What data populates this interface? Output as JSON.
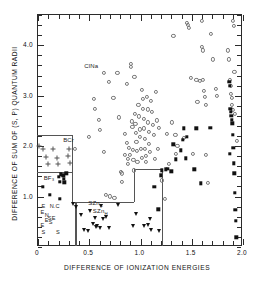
{
  "figure": {
    "type": "structure-field-map",
    "background": "#ffffff",
    "frame_color": "#2b2b2b",
    "region_line_color": "#555555"
  },
  "axes": {
    "xtitle": "DIFFERENCE OF IONIZATION ENERGIES",
    "ytitle": "DIFFERENCE OF SUM OF (S, P) QUANTUM RADII",
    "xlim": [
      0,
      2.0
    ],
    "ylim": [
      0,
      4.6
    ],
    "xticklabels": [
      "0",
      "0.5",
      "1.0",
      "1.5",
      "2.0"
    ],
    "xtickvalues": [
      0,
      0.5,
      1.0,
      1.5,
      2.0
    ],
    "yticklabels": [
      "1.0",
      "2.0",
      "3.0",
      "4.0"
    ],
    "ytickvalues": [
      1.0,
      2.0,
      3.0,
      4.0
    ],
    "xminor_step": 0.1,
    "yminor_step": 0.2,
    "grid": false
  },
  "region_labels": [
    {
      "name": "rocksalt",
      "text": "ClNa",
      "x": 0.46,
      "y": 3.55
    },
    {
      "name": "bcr",
      "text": "BCr",
      "x": 0.255,
      "y": 2.08
    },
    {
      "name": "bf3",
      "text": "BF₃",
      "x": 0.065,
      "y": 1.33
    },
    {
      "name": "szn-c",
      "text": "SZn",
      "sub": "C",
      "x": 0.5,
      "y": 0.83
    },
    {
      "name": "szn-h",
      "text": "SZn",
      "sub": "H",
      "x": 0.545,
      "y": 0.67
    }
  ],
  "corner_letters": [
    {
      "ch": "E",
      "x": 0.045,
      "y": 0.8
    },
    {
      "ch": "N.C",
      "x": 0.125,
      "y": 0.8
    },
    {
      "ch": "E",
      "x": 0.035,
      "y": 0.665
    },
    {
      "ch": "N",
      "x": 0.075,
      "y": 0.615
    },
    {
      "ch": "S",
      "x": 0.105,
      "y": 0.565
    },
    {
      "ch": "E",
      "x": 0.075,
      "y": 0.525
    },
    {
      "ch": "E",
      "x": 0.145,
      "y": 0.565
    },
    {
      "ch": "S",
      "x": 0.115,
      "y": 0.475
    },
    {
      "ch": "E",
      "x": 0.035,
      "y": 0.41
    },
    {
      "ch": "S",
      "x": 0.045,
      "y": 0.27
    },
    {
      "ch": "S",
      "x": 0.185,
      "y": 0.27
    }
  ],
  "region_boundaries": [
    {
      "name": "bcr-box-top",
      "orient": "h",
      "x0": 0.0,
      "x1": 0.345,
      "y": 2.2
    },
    {
      "name": "bcr-box-right",
      "orient": "v",
      "x": 0.345,
      "y0": 0.86,
      "y1": 2.2
    },
    {
      "name": "bf3-divider",
      "orient": "h",
      "x0": 0.0,
      "x1": 0.345,
      "y": 1.47
    },
    {
      "name": "szn-box-top",
      "orient": "h",
      "x0": 0.345,
      "x1": 0.945,
      "y": 0.875
    },
    {
      "name": "szn-riser",
      "orient": "v",
      "x": 0.945,
      "y0": 0.875,
      "y1": 1.52
    },
    {
      "name": "szn-shelf",
      "orient": "h",
      "x0": 0.945,
      "x1": 1.215,
      "y": 1.52
    },
    {
      "name": "szn-right",
      "orient": "v",
      "x": 1.215,
      "y0": 0.0,
      "y1": 1.52
    },
    {
      "name": "corner-box-right",
      "orient": "v",
      "x": 0.375,
      "y0": 0.0,
      "y1": 0.875
    }
  ],
  "chart_data": {
    "type": "scatter",
    "title": "",
    "xlabel": "DIFFERENCE OF IONIZATION ENERGIES",
    "ylabel": "DIFFERENCE OF SUM OF (S, P) QUANTUM RADII",
    "xlim": [
      0,
      2.0
    ],
    "ylim": [
      0,
      4.6
    ],
    "series": [
      {
        "name": "ClNa (rock salt)",
        "marker": "open-circle",
        "color": "#777777",
        "points": [
          [
            0.37,
            1.93
          ],
          [
            0.51,
            2.17
          ],
          [
            0.555,
            2.92
          ],
          [
            0.565,
            2.72
          ],
          [
            0.6,
            2.5
          ],
          [
            0.615,
            2.3
          ],
          [
            0.65,
            3.43
          ],
          [
            0.655,
            1.86
          ],
          [
            0.67,
            1.02
          ],
          [
            0.7,
            3.26
          ],
          [
            0.715,
            0.985
          ],
          [
            0.745,
            2.93
          ],
          [
            0.755,
            0.96
          ],
          [
            0.785,
            3.44
          ],
          [
            0.8,
            2.55
          ],
          [
            0.815,
            1.47
          ],
          [
            0.825,
            1.44
          ],
          [
            0.83,
            1.27
          ],
          [
            0.855,
            2.22
          ],
          [
            0.86,
            1.8
          ],
          [
            0.875,
            3.22
          ],
          [
            0.88,
            2.05
          ],
          [
            0.885,
            1.73
          ],
          [
            0.89,
            1.62
          ],
          [
            0.9,
            1.95
          ],
          [
            0.905,
            1.81
          ],
          [
            0.915,
            3.61
          ],
          [
            0.92,
            3.55
          ],
          [
            0.925,
            2.47
          ],
          [
            0.93,
            2.36
          ],
          [
            0.935,
            1.9
          ],
          [
            0.94,
            1.7
          ],
          [
            0.945,
            1.5
          ],
          [
            0.95,
            3.35
          ],
          [
            0.955,
            2.62
          ],
          [
            0.96,
            2.42
          ],
          [
            0.965,
            2.24
          ],
          [
            0.97,
            2.06
          ],
          [
            0.975,
            1.88
          ],
          [
            0.98,
            1.66
          ],
          [
            0.99,
            2.8
          ],
          [
            0.995,
            2.57
          ],
          [
            1.0,
            2.31
          ],
          [
            1.005,
            2.16
          ],
          [
            1.01,
            1.92
          ],
          [
            1.02,
            1.75
          ],
          [
            1.025,
            3.09
          ],
          [
            1.03,
            2.91
          ],
          [
            1.035,
            2.72
          ],
          [
            1.04,
            2.52
          ],
          [
            1.045,
            2.33
          ],
          [
            1.05,
            2.13
          ],
          [
            1.055,
            1.93
          ],
          [
            1.06,
            1.79
          ],
          [
            1.065,
            1.66
          ],
          [
            1.07,
            2.95
          ],
          [
            1.08,
            2.71
          ],
          [
            1.085,
            2.45
          ],
          [
            1.09,
            2.27
          ],
          [
            1.095,
            2.02
          ],
          [
            1.1,
            1.86
          ],
          [
            1.11,
            2.88
          ],
          [
            1.12,
            2.66
          ],
          [
            1.13,
            2.4
          ],
          [
            1.14,
            2.21
          ],
          [
            1.15,
            1.73
          ],
          [
            1.16,
            3.06
          ],
          [
            1.17,
            2.49
          ],
          [
            1.18,
            1.93
          ],
          [
            1.19,
            2.34
          ],
          [
            1.22,
            1.3
          ],
          [
            1.245,
            0.93
          ],
          [
            1.265,
            2.22
          ],
          [
            1.29,
            1.63
          ],
          [
            1.315,
            2.45
          ],
          [
            1.33,
            4.16
          ],
          [
            1.35,
            2.2
          ],
          [
            1.355,
            1.82
          ],
          [
            1.37,
            1.98
          ],
          [
            1.43,
            2.15
          ],
          [
            1.46,
            4.42
          ],
          [
            1.475,
            4.38
          ],
          [
            1.48,
            4.33
          ],
          [
            1.5,
            3.33
          ],
          [
            1.52,
            1.83
          ],
          [
            1.555,
            3.3
          ],
          [
            1.565,
            2.85
          ],
          [
            1.59,
            3.28
          ],
          [
            1.605,
            4.46
          ],
          [
            1.61,
            3.95
          ],
          [
            1.615,
            3.88
          ],
          [
            1.62,
            3.3
          ],
          [
            1.63,
            3.08
          ],
          [
            1.64,
            2.96
          ],
          [
            1.645,
            2.8
          ],
          [
            1.65,
            1.8
          ],
          [
            1.665,
            1.25
          ],
          [
            1.7,
            4.2
          ],
          [
            1.72,
            3.7
          ],
          [
            1.745,
            3.12
          ],
          [
            1.755,
            2.98
          ],
          [
            1.865,
            3.88
          ],
          [
            1.875,
            3.7
          ],
          [
            1.885,
            3.3
          ],
          [
            1.89,
            3.18
          ],
          [
            1.895,
            3.02
          ],
          [
            1.9,
            2.93
          ],
          [
            1.905,
            2.8
          ],
          [
            1.91,
            2.7
          ],
          [
            1.915,
            4.46
          ],
          [
            1.92,
            4.36
          ],
          [
            1.925,
            3.45
          ],
          [
            1.93,
            2.62
          ],
          [
            1.95,
            2.08
          ]
        ]
      },
      {
        "name": "BCr",
        "marker": "plus",
        "color": "#555555",
        "points": [
          [
            0.015,
            1.99
          ],
          [
            0.055,
            1.93
          ],
          [
            0.085,
            1.77
          ],
          [
            0.105,
            1.63
          ],
          [
            0.16,
            1.93
          ],
          [
            0.195,
            1.74
          ],
          [
            0.205,
            1.62
          ],
          [
            0.3,
            1.79
          ],
          [
            0.315,
            1.93
          ],
          [
            0.325,
            1.64
          ]
        ]
      },
      {
        "name": "BF3 / other (filled square, low-left)",
        "marker": "filled-square",
        "color": "#111111",
        "points": [
          [
            0.055,
            1.17
          ],
          [
            0.125,
            1.02
          ],
          [
            0.215,
            1.37
          ],
          [
            0.22,
            1.27
          ],
          [
            0.235,
            1.42
          ],
          [
            0.255,
            1.4
          ],
          [
            0.26,
            1.33
          ],
          [
            0.265,
            1.26
          ],
          [
            0.285,
            1.44
          ],
          [
            0.225,
            0.93
          ]
        ]
      },
      {
        "name": "SZn (tetrahedral)",
        "marker": "down-triangle",
        "color": "#111111",
        "points": [
          [
            0.355,
            0.84
          ],
          [
            0.385,
            0.78
          ],
          [
            0.425,
            0.62
          ],
          [
            0.455,
            0.31
          ],
          [
            0.5,
            0.3
          ],
          [
            0.515,
            0.7
          ],
          [
            0.545,
            0.44
          ],
          [
            0.565,
            0.55
          ],
          [
            0.575,
            0.38
          ],
          [
            0.59,
            0.39
          ],
          [
            0.615,
            0.36
          ],
          [
            0.62,
            0.79
          ],
          [
            0.645,
            0.54
          ],
          [
            0.675,
            0.57
          ],
          [
            0.7,
            0.36
          ],
          [
            0.79,
            0.81
          ],
          [
            0.935,
            0.39
          ],
          [
            0.965,
            0.63
          ],
          [
            1.04,
            0.4
          ],
          [
            1.085,
            0.41
          ],
          [
            1.1,
            0.54
          ],
          [
            1.115,
            0.32
          ],
          [
            1.19,
            0.3
          ]
        ]
      },
      {
        "name": "High-ionization filled squares",
        "marker": "filled-square",
        "color": "#111111",
        "points": [
          [
            1.145,
            1.17
          ],
          [
            1.185,
            0.73
          ],
          [
            1.21,
            1.4
          ],
          [
            1.215,
            1.5
          ],
          [
            1.255,
            1.52
          ],
          [
            1.275,
            1.53
          ],
          [
            1.31,
            1.48
          ],
          [
            1.33,
            2.02
          ],
          [
            1.355,
            1.72
          ],
          [
            1.4,
            1.9
          ],
          [
            1.425,
            2.1
          ],
          [
            1.435,
            2.33
          ],
          [
            1.45,
            1.74
          ],
          [
            1.46,
            2.17
          ],
          [
            1.535,
            1.52
          ],
          [
            1.555,
            2.33
          ],
          [
            1.6,
            1.24
          ],
          [
            1.69,
            2.34
          ],
          [
            1.875,
            3.25
          ],
          [
            1.88,
            3.18
          ],
          [
            1.885,
            2.72
          ],
          [
            1.89,
            2.66
          ],
          [
            1.895,
            2.58
          ],
          [
            1.9,
            2.5
          ],
          [
            1.905,
            2.43
          ],
          [
            1.91,
            2.2
          ],
          [
            1.915,
            1.95
          ],
          [
            1.92,
            1.64
          ],
          [
            1.925,
            1.44
          ],
          [
            1.93,
            1.05
          ],
          [
            1.935,
            0.72
          ],
          [
            1.94,
            0.5
          ],
          [
            1.945,
            0.17
          ],
          [
            1.88,
            1.83
          ]
        ]
      }
    ]
  }
}
